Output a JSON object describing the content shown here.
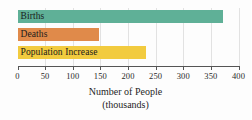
{
  "chart_data": {
    "type": "bar",
    "orientation": "horizontal",
    "title": "",
    "categories": [
      "Births",
      "Deaths",
      "Population Increase"
    ],
    "values": [
      372,
      148,
      233
    ],
    "colors": [
      "#5FB097",
      "#E08A4A",
      "#F2CB3F"
    ],
    "xlabel": "Number of People",
    "xlabel_line2": "(thousands)",
    "ylabel": "",
    "xlim": [
      0,
      400
    ],
    "xticks": [
      0,
      50,
      100,
      150,
      200,
      250,
      300,
      350,
      400
    ],
    "xtick_labels": [
      "0",
      "50",
      "100",
      "150",
      "200",
      "250",
      "300",
      "350",
      "400"
    ],
    "grid": true,
    "grid_axis": "x",
    "grid_color": "#e2e2e2",
    "legend": false,
    "labels_inside_bars": true,
    "axis_color": "#555555"
  }
}
